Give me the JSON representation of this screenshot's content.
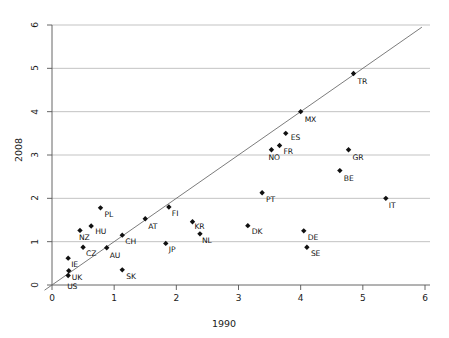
{
  "chart_data": {
    "type": "scatter",
    "title": "",
    "xlabel": "1990",
    "ylabel": "2008",
    "xlim": [
      0,
      6
    ],
    "ylim": [
      0,
      6
    ],
    "xticks": [
      0,
      1,
      2,
      3,
      4,
      5,
      6
    ],
    "yticks": [
      0,
      1,
      2,
      3,
      4,
      5,
      6
    ],
    "xtick_labels": [
      "0",
      "1",
      "2",
      "3",
      "4",
      "5",
      "6"
    ],
    "ytick_labels": [
      "0",
      "1",
      "2",
      "3",
      "4",
      "5",
      "6"
    ],
    "grid": "horizontal",
    "legend": "none",
    "reference_line": {
      "name": "identity-line",
      "type": "line",
      "equation": "y = x",
      "from": [
        0,
        0
      ],
      "to": [
        6,
        6
      ]
    },
    "marker": "diamond",
    "marker_color": "#111111",
    "grid_color": "#b4b4b4",
    "axis_color": "#555555",
    "points": [
      {
        "label": "US",
        "x": 0.26,
        "y": 0.22
      },
      {
        "label": "UK",
        "x": 0.27,
        "y": 0.33
      },
      {
        "label": "IE",
        "x": 0.26,
        "y": 0.62
      },
      {
        "label": "CZ",
        "x": 0.5,
        "y": 0.87
      },
      {
        "label": "NZ",
        "x": 0.45,
        "y": 1.26
      },
      {
        "label": "HU",
        "x": 0.63,
        "y": 1.36
      },
      {
        "label": "PL",
        "x": 0.78,
        "y": 1.78
      },
      {
        "label": "AU",
        "x": 0.88,
        "y": 0.86
      },
      {
        "label": "CH",
        "x": 1.13,
        "y": 1.15
      },
      {
        "label": "SK",
        "x": 1.13,
        "y": 0.35
      },
      {
        "label": "AT",
        "x": 1.5,
        "y": 1.53
      },
      {
        "label": "JP",
        "x": 1.83,
        "y": 0.96
      },
      {
        "label": "FI",
        "x": 1.88,
        "y": 1.8
      },
      {
        "label": "KR",
        "x": 2.26,
        "y": 1.46
      },
      {
        "label": "NL",
        "x": 2.38,
        "y": 1.18
      },
      {
        "label": "DK",
        "x": 3.15,
        "y": 1.37
      },
      {
        "label": "PT",
        "x": 3.38,
        "y": 2.13
      },
      {
        "label": "NO",
        "x": 3.53,
        "y": 3.12
      },
      {
        "label": "FR",
        "x": 3.66,
        "y": 3.22
      },
      {
        "label": "ES",
        "x": 3.76,
        "y": 3.5
      },
      {
        "label": "MX",
        "x": 4.0,
        "y": 4.0
      },
      {
        "label": "DE",
        "x": 4.05,
        "y": 1.25
      },
      {
        "label": "SE",
        "x": 4.1,
        "y": 0.87
      },
      {
        "label": "BE",
        "x": 4.63,
        "y": 2.64
      },
      {
        "label": "GR",
        "x": 4.77,
        "y": 3.12
      },
      {
        "label": "TR",
        "x": 4.85,
        "y": 4.88
      },
      {
        "label": "IT",
        "x": 5.37,
        "y": 2.0
      }
    ],
    "label_offsets": {
      "US": [
        -1,
        15
      ],
      "UK": [
        3,
        10
      ],
      "IE": [
        3,
        10
      ],
      "CZ": [
        3,
        10
      ],
      "NZ": [
        -1,
        11
      ],
      "HU": [
        4,
        9
      ],
      "PL": [
        4,
        10
      ],
      "AU": [
        3,
        11
      ],
      "CH": [
        3,
        10
      ],
      "SK": [
        4,
        10
      ],
      "AT": [
        3,
        11
      ],
      "JP": [
        3,
        10
      ],
      "FI": [
        3,
        10
      ],
      "KR": [
        2,
        8
      ],
      "NL": [
        2,
        10
      ],
      "DK": [
        4,
        9
      ],
      "PT": [
        4,
        10
      ],
      "NO": [
        -3,
        11
      ],
      "FR": [
        4,
        10
      ],
      "ES": [
        5,
        8
      ],
      "MX": [
        4,
        11
      ],
      "DE": [
        4,
        10
      ],
      "SE": [
        4,
        10
      ],
      "BE": [
        4,
        11
      ],
      "GR": [
        4,
        11
      ],
      "TR": [
        4,
        11
      ],
      "IT": [
        3,
        11
      ]
    }
  }
}
